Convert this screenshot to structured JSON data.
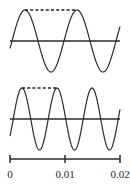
{
  "figure": {
    "background_color": "#ffffff",
    "stroke_color": "#2b2b2b",
    "dash_color": "#1f1f1f",
    "axis_color": "#2b2b2b",
    "label_color": "#1f1f1f"
  },
  "axis": {
    "name": "time-axis",
    "x_start_px": 10,
    "x_end_px": 120,
    "y_px": 159,
    "tick_labels": [
      "0",
      "0.01",
      "0.02"
    ],
    "tick_values": [
      0,
      0.01,
      0.02
    ],
    "tick_x_px": [
      10,
      65,
      120
    ],
    "tick_half_height_px": 4,
    "label_y_px": 178
  },
  "waves": [
    {
      "name": "upper-waveform",
      "baseline_y_px": 41,
      "amplitude_px": 31,
      "period_px": 52,
      "period_seconds": 0.01,
      "cycles": 2,
      "first_peak_x_px": 25,
      "second_peak_x_px": 77,
      "x_start_px": 10,
      "x_end_px": 120,
      "dash": {
        "name": "upper-period-marker",
        "x1_px": 25,
        "x2_px": 77,
        "y_px": 10
      }
    },
    {
      "name": "lower-waveform",
      "baseline_y_px": 119,
      "amplitude_px": 31,
      "period_px": 35,
      "period_seconds": 0.0067,
      "cycles": 3,
      "first_peak_x_px": 22,
      "second_peak_x_px": 57,
      "x_start_px": 10,
      "x_end_px": 120,
      "dash": {
        "name": "lower-period-marker",
        "x1_px": 22,
        "x2_px": 57,
        "y_px": 88
      }
    }
  ],
  "chart_data": {
    "type": "line",
    "title": "",
    "subtitle": "",
    "xlabel": "",
    "ylabel": "",
    "xlim": [
      0,
      0.02
    ],
    "grid": false,
    "legend": null,
    "x_tick_labels": [
      "0",
      "0.01",
      "0.02"
    ],
    "x_ticks": [
      0,
      0.01,
      0.02
    ],
    "series": [
      {
        "name": "upper sine wave",
        "waveform": "sine",
        "amplitude": 1,
        "period": 0.01,
        "frequency_hz": 100,
        "cycles_shown": 2,
        "phase": 0,
        "annotation": "dashed line spanning one period between successive peaks"
      },
      {
        "name": "lower sine wave",
        "waveform": "sine",
        "amplitude": 1,
        "period": 0.0067,
        "frequency_hz": 150,
        "cycles_shown": 3,
        "phase": 0,
        "annotation": "dashed line spanning one period between successive peaks"
      }
    ],
    "annotations": [
      {
        "name": "upper-period-dash",
        "type": "horizontal-dashed-segment",
        "series": "upper sine wave"
      },
      {
        "name": "lower-period-dash",
        "type": "horizontal-dashed-segment",
        "series": "lower sine wave"
      }
    ]
  }
}
